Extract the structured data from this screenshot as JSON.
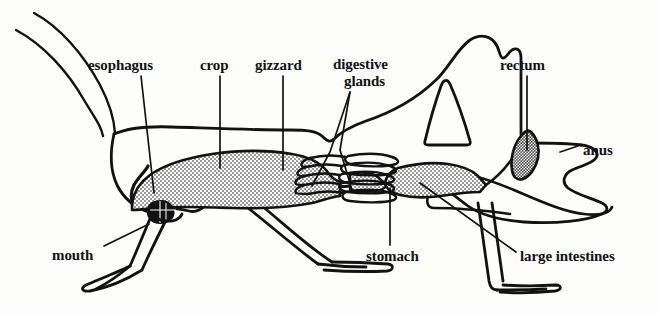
{
  "figure": {
    "kind": "anatomical-line-diagram",
    "background_color": "#fdfdfc",
    "ink_color": "#121212",
    "organ_fill_color": "#9a9a9a",
    "labels": [
      {
        "id": "esophagus",
        "text": "esophagus",
        "x": 88,
        "y": 58,
        "align": "left",
        "lines": 1
      },
      {
        "id": "crop",
        "text": "crop",
        "x": 200,
        "y": 58,
        "align": "left",
        "lines": 1
      },
      {
        "id": "gizzard",
        "text": "gizzard",
        "x": 255,
        "y": 58,
        "align": "left",
        "lines": 1
      },
      {
        "id": "digestive-glands",
        "text": "digestive",
        "x": 333,
        "y": 57,
        "align": "center",
        "lines": 1
      },
      {
        "id": "digestive-glands-2",
        "text": "glands",
        "x": 344,
        "y": 74,
        "align": "center",
        "lines": 1
      },
      {
        "id": "rectum",
        "text": "rectum",
        "x": 500,
        "y": 58,
        "align": "left",
        "lines": 1
      },
      {
        "id": "anus",
        "text": "anus",
        "x": 583,
        "y": 143,
        "align": "left",
        "lines": 1
      },
      {
        "id": "mouth",
        "text": "mouth",
        "x": 52,
        "y": 248,
        "align": "left",
        "lines": 1
      },
      {
        "id": "stomach",
        "text": "stomach",
        "x": 366,
        "y": 249,
        "align": "left",
        "lines": 1
      },
      {
        "id": "large-intestines",
        "text": "large intestines",
        "x": 520,
        "y": 249,
        "align": "left",
        "lines": 1
      }
    ],
    "organs_depicted": [
      "mouth",
      "esophagus",
      "crop",
      "gizzard",
      "digestive glands",
      "stomach",
      "large intestines",
      "rectum",
      "anus"
    ],
    "body_parts_depicted": [
      "antennae",
      "head",
      "thorax",
      "abdomen",
      "wing",
      "foreleg",
      "middle leg",
      "hind leg femur",
      "hind leg tibia"
    ]
  }
}
